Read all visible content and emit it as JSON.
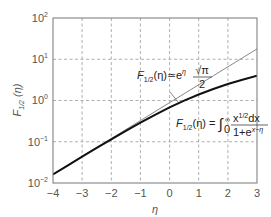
{
  "chart_data": {
    "type": "line",
    "title": "",
    "xlabel": "η",
    "ylabel": "F1/2 (η)",
    "xlim": [
      -4,
      3
    ],
    "ylim": [
      0.01,
      100
    ],
    "yscale": "log",
    "grid": true,
    "grid_style": "dashed",
    "x_ticks": [
      "−4",
      "−3",
      "−2",
      "−1",
      "0",
      "1",
      "2",
      "3"
    ],
    "y_ticks": [
      {
        "base": "10",
        "exp": "−2"
      },
      {
        "base": "10",
        "exp": "−1"
      },
      {
        "base": "10",
        "exp": "0"
      },
      {
        "base": "10",
        "exp": "1"
      },
      {
        "base": "10",
        "exp": "2"
      }
    ],
    "x": [
      -4,
      -3.5,
      -3,
      -2.5,
      -2,
      -1.5,
      -1,
      -0.5,
      0,
      0.5,
      1,
      1.5,
      2,
      2.5,
      3
    ],
    "series": [
      {
        "name": "F1/2(η) = ∫0^∞ x^(1/2)dx / (1+e^(x−η))",
        "style": "thick-black",
        "values": [
          0.0161,
          0.0265,
          0.0434,
          0.0708,
          0.1147,
          0.1836,
          0.2905,
          0.4502,
          0.6781,
          0.989,
          1.3964,
          1.903,
          2.5023,
          3.1928,
          3.977
        ]
      },
      {
        "name": "F1/2(η) ≃ e^η √π/2",
        "style": "thin-gray",
        "values": [
          0.0162,
          0.0268,
          0.0441,
          0.0727,
          0.1199,
          0.1977,
          0.326,
          0.5375,
          0.8862,
          1.4611,
          2.4091,
          3.972,
          6.5486,
          10.797,
          17.801
        ]
      }
    ],
    "annotations": [
      {
        "text": "F1/2(η)≃e^η √π/2",
        "target_series": 1
      },
      {
        "text": "F1/2(η) = ∫0^∞ x^1/2 dx / 1+e^(x−η)",
        "target_series": 0
      }
    ]
  },
  "labels": {
    "xlabel": "η",
    "ylabel_main": "F",
    "ylabel_sub": "1/2",
    "ylabel_arg": " (η)",
    "approx_F": "F",
    "approx_sub": "1/2",
    "approx_lhs": "(η)≃e",
    "approx_exp": "η",
    "approx_num": "√π",
    "approx_den": "2",
    "exact_F": "F",
    "exact_sub": "1/2",
    "exact_lhs": "(η) = ",
    "exact_int": "∫",
    "exact_lower": "0",
    "exact_upper": "∞",
    "exact_num": "x",
    "exact_num_exp": "1/2",
    "exact_num_tail": "dx",
    "exact_den": "1+e",
    "exact_den_exp": "x−η"
  }
}
